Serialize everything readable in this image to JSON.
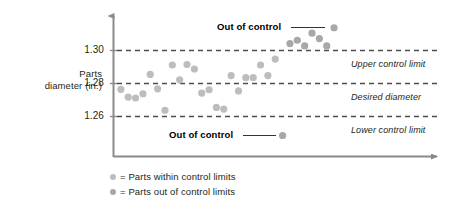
{
  "chart_data": {
    "type": "scatter",
    "title": "",
    "xlabel": "",
    "ylabel": "Parts diameter (in.)",
    "ylim": [
      1.245,
      1.316
    ],
    "xlim": [
      0,
      44
    ],
    "grid": false,
    "legend_position": "below-left",
    "yticks": [
      "1.30",
      "1.28",
      "1.26"
    ],
    "ytick_values": [
      1.3,
      1.28,
      1.26
    ],
    "reference_lines": [
      {
        "value": 1.3,
        "label": "Upper control limit",
        "style": "dashed"
      },
      {
        "value": 1.28,
        "label": "Desired diameter",
        "style": "dashed"
      },
      {
        "value": 1.26,
        "label": "Lower control limit",
        "style": "dashed"
      }
    ],
    "series": [
      {
        "name": "Parts within control limits",
        "color": "#bdbdbd",
        "points": [
          {
            "x": 1,
            "y": 1.2765
          },
          {
            "x": 2,
            "y": 1.2718
          },
          {
            "x": 3,
            "y": 1.2712
          },
          {
            "x": 4,
            "y": 1.2738
          },
          {
            "x": 5,
            "y": 1.2855
          },
          {
            "x": 6,
            "y": 1.2768
          },
          {
            "x": 7,
            "y": 1.2638
          },
          {
            "x": 8,
            "y": 1.2912
          },
          {
            "x": 9,
            "y": 1.2822
          },
          {
            "x": 10,
            "y": 1.2915
          },
          {
            "x": 11,
            "y": 1.2888
          },
          {
            "x": 12,
            "y": 1.2742
          },
          {
            "x": 13,
            "y": 1.2762
          },
          {
            "x": 14,
            "y": 1.2655
          },
          {
            "x": 15,
            "y": 1.2645
          },
          {
            "x": 16,
            "y": 1.2848
          },
          {
            "x": 17,
            "y": 1.2755
          },
          {
            "x": 18,
            "y": 1.2835
          },
          {
            "x": 19,
            "y": 1.2835
          },
          {
            "x": 20,
            "y": 1.2912
          },
          {
            "x": 21,
            "y": 1.2848
          },
          {
            "x": 22,
            "y": 1.2948
          }
        ]
      },
      {
        "name": "Parts out of control limits",
        "color": "#a8a8a8",
        "points": [
          {
            "x": 23,
            "y": 1.2485
          },
          {
            "x": 24,
            "y": 1.3042
          },
          {
            "x": 25,
            "y": 1.3062
          },
          {
            "x": 26,
            "y": 1.3028
          },
          {
            "x": 27,
            "y": 1.3105
          },
          {
            "x": 28,
            "y": 1.3072
          },
          {
            "x": 29,
            "y": 1.3028
          },
          {
            "x": 30,
            "y": 1.3138
          }
        ]
      }
    ],
    "annotations": [
      {
        "text": "Out of control",
        "target": "upper-cluster"
      },
      {
        "text": "Out of control",
        "target": "lower-outlier"
      }
    ]
  },
  "axis": {
    "y_title_line1": "Parts",
    "y_title_line2": "diameter (in.)",
    "tick_1": "1.30",
    "tick_2": "1.28",
    "tick_3": "1.26"
  },
  "limits": {
    "upper": "Upper control limit",
    "desired": "Desired diameter",
    "lower": "Lower control limit"
  },
  "callouts": {
    "upper": "Out of control",
    "lower": "Out of control"
  },
  "legend": {
    "within": "= Parts within control limits",
    "outside": "= Parts out of control limits"
  },
  "colors": {
    "dot_within": "#bdbdbd",
    "dot_outside": "#a8a8a8",
    "axis": "#8a8a8a",
    "dashed": "#4d4d4d",
    "text": "#231f20"
  }
}
